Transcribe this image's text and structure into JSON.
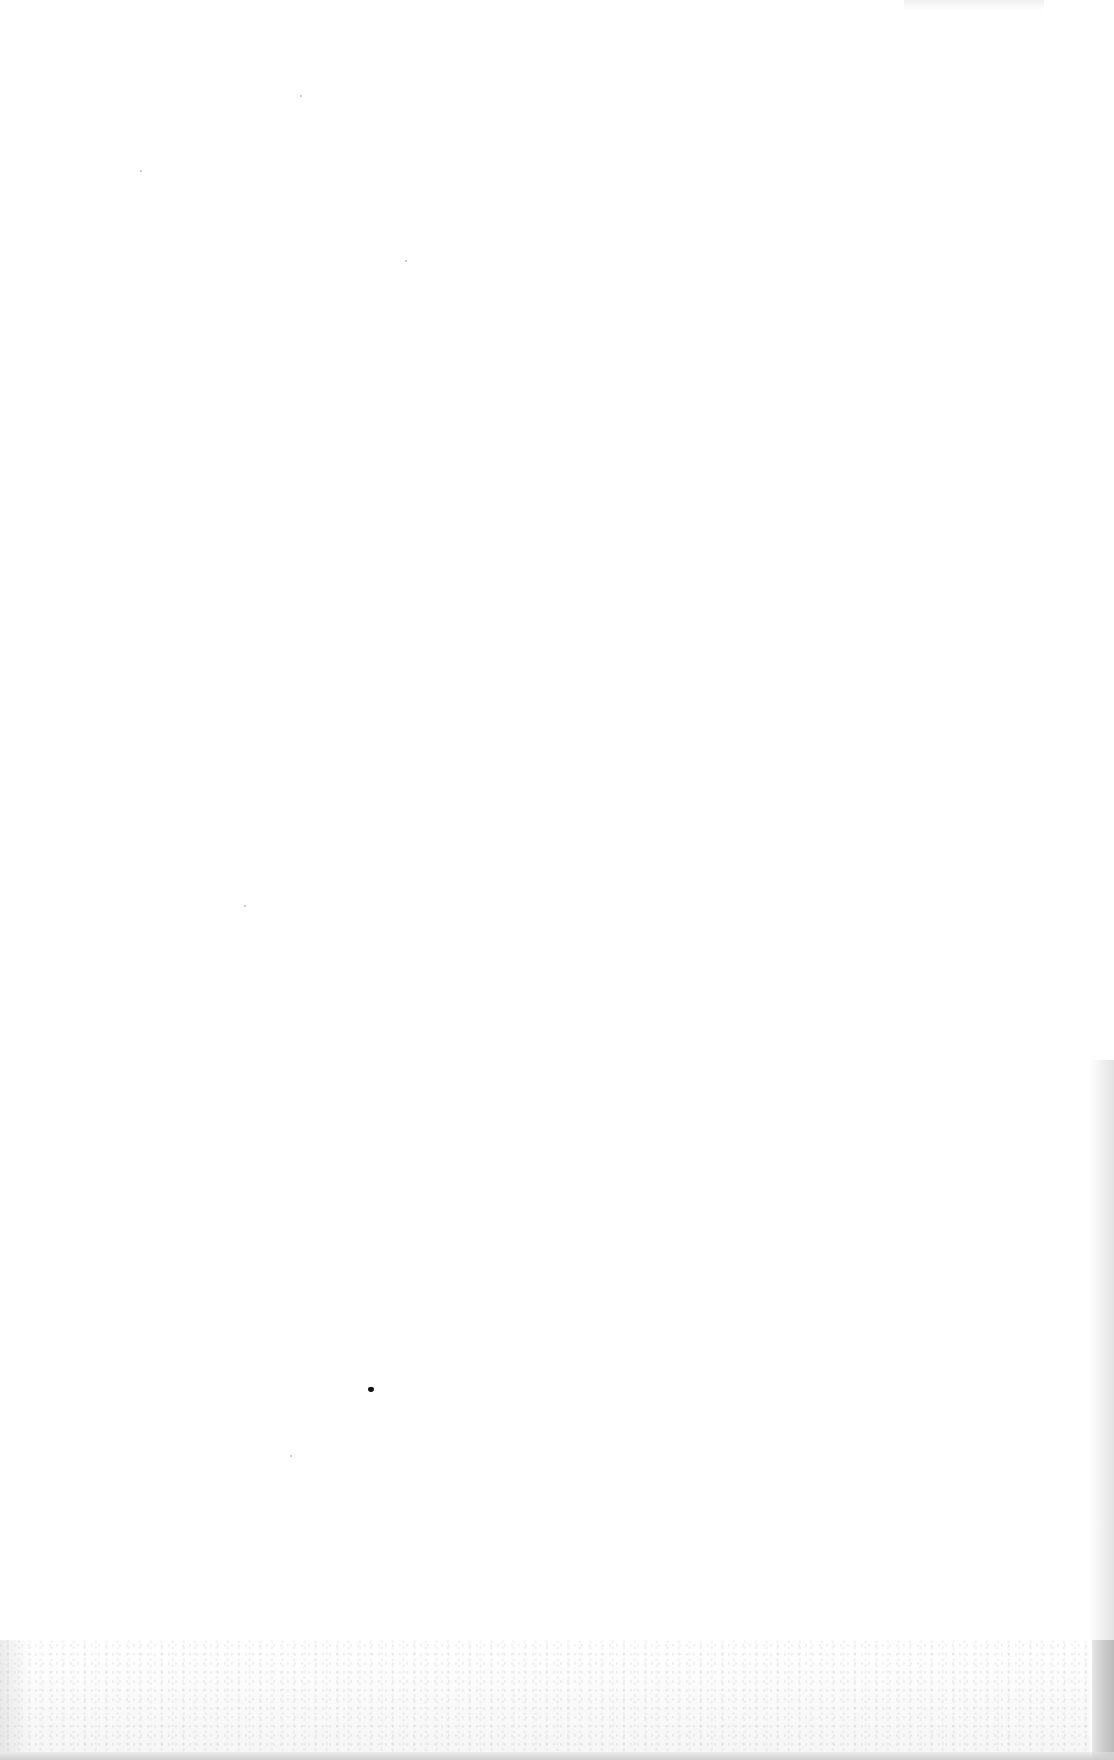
{
  "page": {
    "type": "blank-scanned-page",
    "text_content": [],
    "background_color": "#ffffff",
    "marks": [
      {
        "kind": "ink-speck",
        "x": 370,
        "y": 1389,
        "color": "#111111"
      }
    ],
    "edge_shading_color": "#c8c8c8"
  }
}
